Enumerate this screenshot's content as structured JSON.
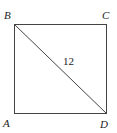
{
  "figure": {
    "shape": "square",
    "vertices": {
      "A": "A",
      "B": "B",
      "C": "C",
      "D": "D"
    },
    "diagonal": {
      "from": "B",
      "to": "D",
      "length_label": "12"
    },
    "colors": {
      "stroke": "#444444",
      "text": "#222222",
      "background": "#ffffff"
    }
  }
}
